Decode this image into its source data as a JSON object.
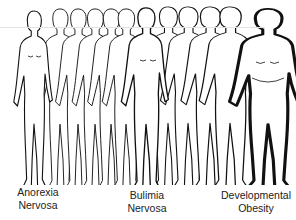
{
  "figure": {
    "figure_count": 12,
    "labels": {
      "left": {
        "line1": "Anorexia",
        "line2": "Nervosa"
      },
      "middle": {
        "line1": "Bulimia",
        "line2": "Nervosa"
      },
      "right": {
        "line1": "Developmental",
        "line2": "Obesity"
      }
    }
  }
}
